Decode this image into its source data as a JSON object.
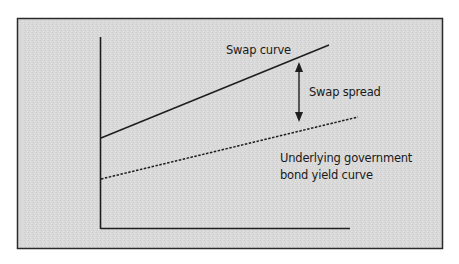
{
  "colors": {
    "background": "#ffffff",
    "panel_fill": "#d9d9d9",
    "panel_border": "#2a2a2a",
    "line": "#1e1e1e",
    "text": "#1a1a1a"
  },
  "labels": {
    "swap_curve": "Swap curve",
    "swap_spread": "Swap spread",
    "govt_curve_line1": "Underlying government",
    "govt_curve_line2": "bond yield curve"
  },
  "diagram": {
    "type": "schematic yield curve comparison",
    "axes": {
      "x_label": "",
      "y_label": "",
      "ticks": "none"
    },
    "series": [
      {
        "name": "Swap curve",
        "style": "solid",
        "start": {
          "x": 101,
          "y": 138
        },
        "end": {
          "x": 329,
          "y": 45
        }
      },
      {
        "name": "Underlying government bond yield curve",
        "style": "dotted",
        "start": {
          "x": 101,
          "y": 179
        },
        "end": {
          "x": 358,
          "y": 117
        }
      }
    ],
    "annotation": {
      "name": "Swap spread",
      "type": "double-headed arrow",
      "x": 299,
      "y_top": 62,
      "y_bottom": 122
    }
  }
}
